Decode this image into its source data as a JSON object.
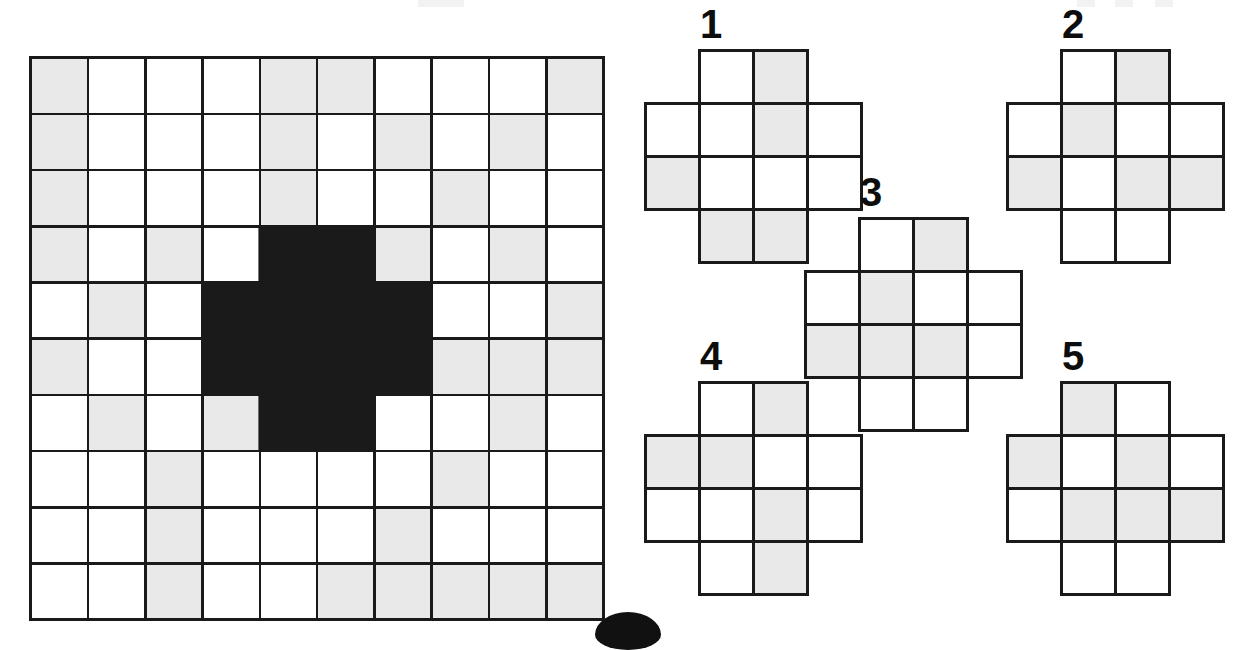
{
  "puzzle": {
    "title": "Pattern Matching Figure Puzzle",
    "type": "visual-analogy",
    "legend": {
      "white": "#ffffff",
      "gray": "#e9e9e9",
      "black": "#1a1a1a",
      "border": "#1a1a1a"
    }
  },
  "main_grid": {
    "name": "main-pattern-grid",
    "rows": 10,
    "cols": 10,
    "cell_codes": {
      "0": "white",
      "1": "gray",
      "2": "black"
    },
    "cells": [
      [
        1,
        0,
        0,
        0,
        1,
        1,
        0,
        0,
        0,
        1
      ],
      [
        1,
        0,
        0,
        0,
        1,
        0,
        1,
        0,
        1,
        0
      ],
      [
        1,
        0,
        0,
        0,
        1,
        0,
        0,
        1,
        0,
        0
      ],
      [
        1,
        0,
        1,
        0,
        2,
        2,
        1,
        0,
        1,
        0
      ],
      [
        0,
        1,
        0,
        2,
        2,
        2,
        2,
        0,
        0,
        1
      ],
      [
        1,
        0,
        0,
        2,
        2,
        2,
        2,
        1,
        1,
        1
      ],
      [
        0,
        1,
        0,
        1,
        2,
        2,
        0,
        0,
        1,
        0
      ],
      [
        0,
        0,
        1,
        0,
        0,
        0,
        0,
        1,
        0,
        0
      ],
      [
        0,
        0,
        1,
        0,
        0,
        0,
        1,
        0,
        0,
        0
      ],
      [
        0,
        0,
        1,
        0,
        0,
        1,
        1,
        1,
        1,
        1
      ]
    ],
    "black_region_shape": "plus",
    "black_region_cells": [
      [
        4,
        5
      ],
      [
        4,
        6
      ],
      [
        5,
        4
      ],
      [
        5,
        5
      ],
      [
        5,
        6
      ],
      [
        5,
        7
      ],
      [
        6,
        4
      ],
      [
        6,
        5
      ],
      [
        6,
        6
      ],
      [
        6,
        7
      ],
      [
        7,
        5
      ],
      [
        7,
        6
      ]
    ]
  },
  "options": [
    {
      "label": "1",
      "name": "option-1",
      "shape": "plus",
      "mask": [
        [
          0,
          1,
          1,
          0
        ],
        [
          1,
          1,
          1,
          1
        ],
        [
          1,
          1,
          1,
          1
        ],
        [
          0,
          1,
          1,
          0
        ]
      ],
      "fills": [
        [
          "",
          "white",
          "gray",
          ""
        ],
        [
          "white",
          "white",
          "gray",
          "white"
        ],
        [
          "gray",
          "white",
          "white",
          "white"
        ],
        [
          "",
          "gray",
          "gray",
          ""
        ]
      ]
    },
    {
      "label": "2",
      "name": "option-2",
      "shape": "plus",
      "mask": [
        [
          0,
          1,
          1,
          0
        ],
        [
          1,
          1,
          1,
          1
        ],
        [
          1,
          1,
          1,
          1
        ],
        [
          0,
          1,
          1,
          0
        ]
      ],
      "fills": [
        [
          "",
          "white",
          "gray",
          ""
        ],
        [
          "white",
          "gray",
          "white",
          "white"
        ],
        [
          "gray",
          "white",
          "gray",
          "gray"
        ],
        [
          "",
          "white",
          "white",
          ""
        ]
      ]
    },
    {
      "label": "3",
      "name": "option-3",
      "shape": "plus",
      "mask": [
        [
          0,
          1,
          1,
          0
        ],
        [
          1,
          1,
          1,
          1
        ],
        [
          1,
          1,
          1,
          1
        ],
        [
          0,
          1,
          1,
          0
        ]
      ],
      "fills": [
        [
          "",
          "white",
          "gray",
          ""
        ],
        [
          "white",
          "gray",
          "white",
          "white"
        ],
        [
          "gray",
          "gray",
          "gray",
          "white"
        ],
        [
          "",
          "white",
          "white",
          ""
        ]
      ]
    },
    {
      "label": "4",
      "name": "option-4",
      "shape": "plus",
      "mask": [
        [
          0,
          1,
          1,
          0
        ],
        [
          1,
          1,
          1,
          1
        ],
        [
          1,
          1,
          1,
          1
        ],
        [
          0,
          1,
          1,
          0
        ]
      ],
      "fills": [
        [
          "",
          "white",
          "gray",
          ""
        ],
        [
          "gray",
          "gray",
          "white",
          "white"
        ],
        [
          "white",
          "white",
          "gray",
          "white"
        ],
        [
          "",
          "white",
          "gray",
          ""
        ]
      ]
    },
    {
      "label": "5",
      "name": "option-5",
      "shape": "plus",
      "mask": [
        [
          0,
          1,
          1,
          0
        ],
        [
          1,
          1,
          1,
          1
        ],
        [
          1,
          1,
          1,
          1
        ],
        [
          0,
          1,
          1,
          0
        ]
      ],
      "fills": [
        [
          "",
          "gray",
          "white",
          ""
        ],
        [
          "gray",
          "white",
          "gray",
          "white"
        ],
        [
          "white",
          "gray",
          "gray",
          "gray"
        ],
        [
          "",
          "white",
          "white",
          ""
        ]
      ]
    }
  ],
  "decorations": {
    "bottom_marker": "page-number-blob"
  }
}
